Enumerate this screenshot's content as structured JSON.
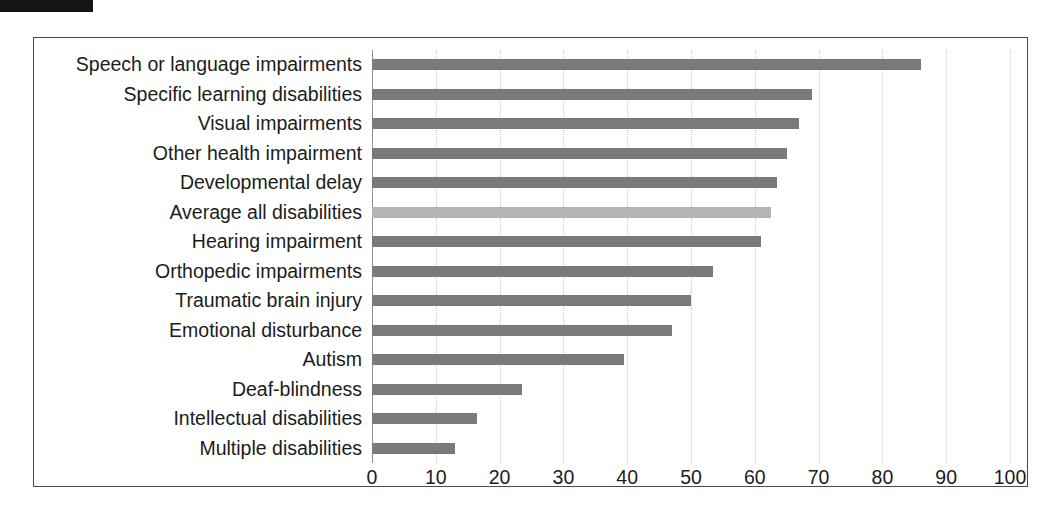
{
  "page": {
    "redaction_bar": "redacted-header-strip"
  },
  "chart_data": {
    "type": "bar",
    "orientation": "horizontal",
    "title": "",
    "subtitle": "",
    "xlabel": "",
    "ylabel": "",
    "xlim": [
      0,
      100
    ],
    "ylim": null,
    "grid": true,
    "legend": null,
    "x_ticks": [
      0,
      10,
      20,
      30,
      40,
      50,
      60,
      70,
      80,
      90,
      100
    ],
    "x_tick_labels": [
      "0",
      "10",
      "20",
      "30",
      "40",
      "50",
      "60",
      "70",
      "80",
      "90",
      "100"
    ],
    "categories": [
      "Speech or language impairments",
      "Specific learning disabilities",
      "Visual impairments",
      "Other health impairment",
      "Developmental delay",
      "Average all disabilities",
      "Hearing impairment",
      "Orthopedic impairments",
      "Traumatic brain injury",
      "Emotional disturbance",
      "Autism",
      "Deaf-blindness",
      "Intellectual disabilities",
      "Multiple disabilities"
    ],
    "values": [
      86,
      69,
      67,
      65,
      63.5,
      62.5,
      61,
      53.5,
      50,
      47,
      39.5,
      23.5,
      16.5,
      13
    ],
    "highlight_index": 5,
    "colors": {
      "bar": "#7a7a7a",
      "bar_highlight": "#b4b4b4",
      "gridline": "#c8c8c8",
      "axis": "#8f8f8f",
      "frame": "#4a4a4a",
      "text": "#1c1c1c"
    }
  }
}
